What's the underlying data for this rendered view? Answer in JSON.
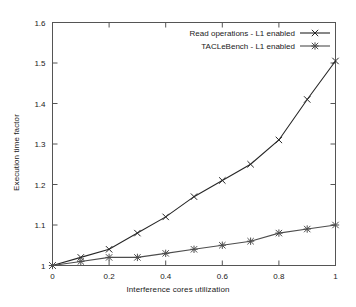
{
  "chart_data": {
    "type": "line",
    "title": "",
    "xlabel": "Interference cores utilization",
    "ylabel": "Execution time factor",
    "xlim": [
      0,
      1
    ],
    "ylim": [
      1,
      1.6
    ],
    "xticks": [
      0,
      0.2,
      0.4,
      0.6,
      0.8,
      1
    ],
    "xticklabels": [
      "0",
      "0.2",
      "0.4",
      "0.6",
      "0.8",
      "1"
    ],
    "yticks": [
      1,
      1.1,
      1.2,
      1.3,
      1.4,
      1.5,
      1.6
    ],
    "yticklabels": [
      "1",
      "1.1",
      "1.2",
      "1.3",
      "1.4",
      "1.5",
      "1.6"
    ],
    "grid": false,
    "legend_position": "top-right",
    "x": [
      0,
      0.1,
      0.2,
      0.3,
      0.4,
      0.5,
      0.6,
      0.7,
      0.8,
      0.9,
      1
    ],
    "series": [
      {
        "name": "Read operations - L1 enabled",
        "marker": "x-cross",
        "color": "#262626",
        "values": [
          1.0,
          1.02,
          1.04,
          1.08,
          1.12,
          1.17,
          1.21,
          1.25,
          1.31,
          1.41,
          1.505
        ]
      },
      {
        "name": "TACLeBench - L1 enabled",
        "marker": "asterisk",
        "color": "#4d4d4d",
        "values": [
          1.0,
          1.01,
          1.02,
          1.02,
          1.03,
          1.04,
          1.05,
          1.06,
          1.08,
          1.09,
          1.1
        ]
      }
    ]
  },
  "legend": {
    "entries": [
      {
        "label": "Read operations - L1 enabled"
      },
      {
        "label": "TACLeBench - L1 enabled"
      }
    ]
  },
  "axes": {
    "x_title": "Interference cores utilization",
    "y_title": "Execution time factor"
  },
  "colors": {
    "frame": "#555555",
    "series_1": "#262626",
    "series_2": "#4d4d4d",
    "text": "#1a1a1a",
    "background": "#ffffff"
  }
}
